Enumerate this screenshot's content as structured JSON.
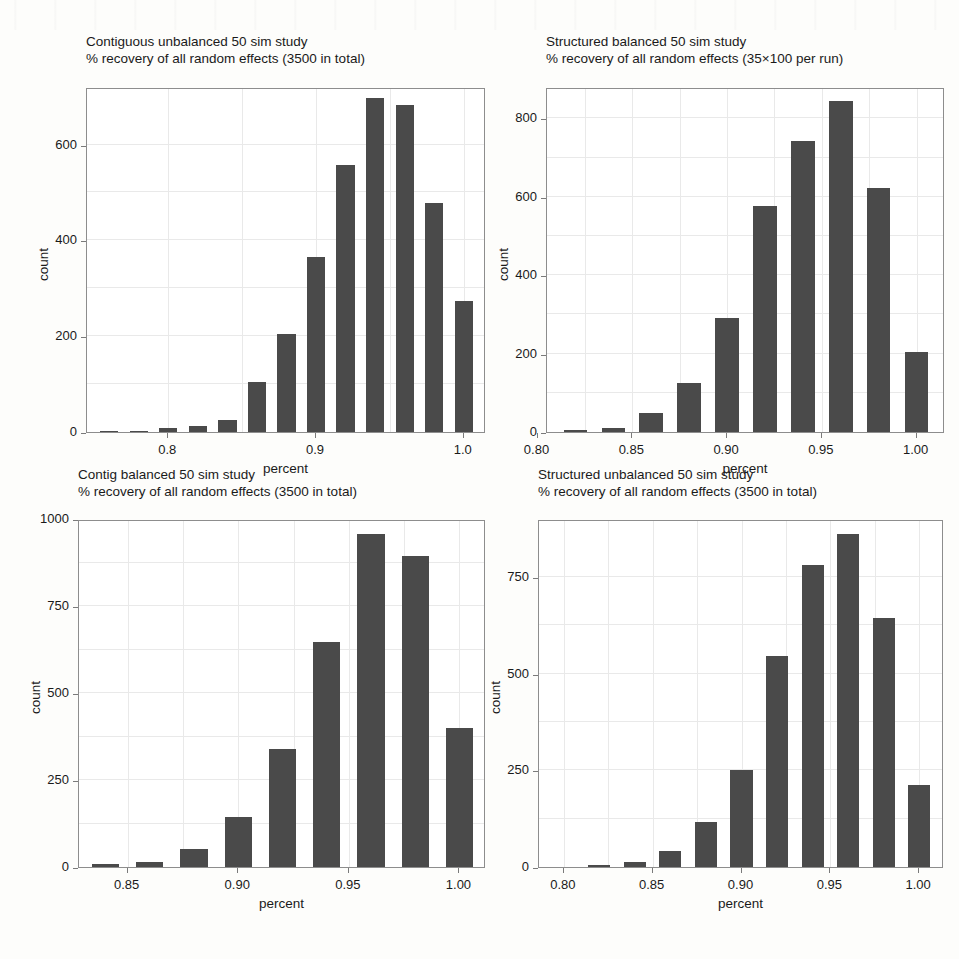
{
  "figure": {
    "background_color": "#fdfdfb",
    "bar_color": "#4a4a4a",
    "axis_color": "#8d8d8d",
    "grid_color": "#e9e9e9",
    "panel_count": 4
  },
  "chart_data": [
    {
      "type": "bar",
      "panel_index": 0,
      "title": "Contiguous unbalanced 50 sim study",
      "subtitle": "% recovery of all random effects (3500 in total)",
      "xlabel": "percent",
      "ylabel": "count",
      "xlim": [
        0.745,
        1.015
      ],
      "ylim": [
        0,
        720
      ],
      "xticks": [
        0.8,
        0.9,
        1.0
      ],
      "xticklabels": [
        "0.8",
        "0.9",
        "1.0"
      ],
      "yticks": [
        0,
        200,
        400,
        600
      ],
      "yticklabels": [
        "0",
        "200",
        "400",
        "600"
      ],
      "grid": true,
      "bin_width": 0.02,
      "categories": [
        0.76,
        0.78,
        0.8,
        0.82,
        0.84,
        0.86,
        0.88,
        0.9,
        0.92,
        0.94,
        0.96,
        0.98,
        1.0
      ],
      "values": [
        2,
        3,
        8,
        13,
        26,
        105,
        205,
        365,
        558,
        697,
        682,
        478,
        274
      ]
    },
    {
      "type": "bar",
      "panel_index": 1,
      "title": "Structured balanced 50 sim study",
      "subtitle": "% recovery of all random effects (35×100 per run)",
      "xlabel": "percent",
      "ylabel": "count",
      "xlim": [
        0.805,
        1.015
      ],
      "ylim": [
        0,
        880
      ],
      "xticks": [
        0.8,
        0.85,
        0.9,
        0.95,
        1.0
      ],
      "xticklabels": [
        "0.80",
        "0.85",
        "0.90",
        "0.95",
        "1.00"
      ],
      "yticks": [
        0,
        200,
        400,
        600,
        800
      ],
      "yticklabels": [
        "0",
        "200",
        "400",
        "600",
        "800"
      ],
      "grid": true,
      "bin_width": 0.02,
      "categories": [
        0.82,
        0.84,
        0.86,
        0.88,
        0.9,
        0.92,
        0.94,
        0.96,
        0.98,
        1.0
      ],
      "values": [
        5,
        10,
        48,
        125,
        290,
        577,
        742,
        845,
        622,
        205
      ]
    },
    {
      "type": "bar",
      "panel_index": 2,
      "title": "Contig balanced 50 sim study",
      "subtitle": "% recovery of all random effects (3500 in total)",
      "xlabel": "percent",
      "ylabel": "count",
      "xlim": [
        0.828,
        1.012
      ],
      "ylim": [
        0,
        1000
      ],
      "xticks": [
        0.85,
        0.9,
        0.95,
        1.0
      ],
      "xticklabels": [
        "0.85",
        "0.90",
        "0.95",
        "1.00"
      ],
      "yticks": [
        0,
        250,
        500,
        750,
        1000
      ],
      "yticklabels": [
        "0",
        "250",
        "500",
        "750",
        "1000"
      ],
      "grid": true,
      "bin_width": 0.02,
      "categories": [
        0.84,
        0.86,
        0.88,
        0.9,
        0.92,
        0.94,
        0.96,
        0.98,
        1.0
      ],
      "values": [
        8,
        13,
        52,
        143,
        339,
        647,
        958,
        893,
        400
      ]
    },
    {
      "type": "bar",
      "panel_index": 3,
      "title": "Structured unbalanced 50 sim study",
      "subtitle": "% recovery of all random effects (3500 in total)",
      "xlabel": "percent",
      "ylabel": "count",
      "xlim": [
        0.786,
        1.014
      ],
      "ylim": [
        0,
        900
      ],
      "xticks": [
        0.8,
        0.85,
        0.9,
        0.95,
        1.0
      ],
      "xticklabels": [
        "0.80",
        "0.85",
        "0.90",
        "0.95",
        "1.00"
      ],
      "yticks": [
        0,
        250,
        500,
        750
      ],
      "yticklabels": [
        "0",
        "250",
        "500",
        "750"
      ],
      "grid": true,
      "bin_width": 0.02,
      "categories": [
        0.82,
        0.84,
        0.86,
        0.88,
        0.9,
        0.92,
        0.94,
        0.96,
        0.98,
        1.0
      ],
      "values": [
        5,
        14,
        42,
        117,
        250,
        545,
        780,
        860,
        645,
        212
      ]
    }
  ]
}
